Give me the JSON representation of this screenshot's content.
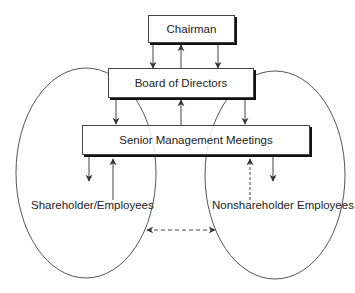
{
  "diagram": {
    "boxes": {
      "chairman": "Chairman",
      "board": "Board of Directors",
      "senior_management": "Senior Management Meetings"
    },
    "groups": {
      "shareholder_employees": "Shareholder/Employees",
      "nonshareholder_employees": "Nonshareholder Employees"
    },
    "arrows": [
      {
        "from": "Chairman",
        "to": "Board of Directors",
        "style": "solid"
      },
      {
        "from": "Board of Directors",
        "to": "Chairman",
        "style": "solid"
      },
      {
        "from": "Chairman",
        "to": "Board of Directors",
        "style": "solid"
      },
      {
        "from": "Board of Directors",
        "to": "Senior Management Meetings",
        "style": "solid"
      },
      {
        "from": "Senior Management Meetings",
        "to": "Board of Directors",
        "style": "solid"
      },
      {
        "from": "Board of Directors",
        "to": "Senior Management Meetings",
        "style": "solid"
      },
      {
        "from": "Senior Management Meetings",
        "to": "Shareholder/Employees",
        "style": "solid"
      },
      {
        "from": "Shareholder/Employees",
        "to": "Senior Management Meetings",
        "style": "solid"
      },
      {
        "from": "Nonshareholder Employees",
        "to": "Senior Management Meetings",
        "style": "dashed"
      },
      {
        "from": "Senior Management Meetings",
        "to": "Nonshareholder Employees",
        "style": "solid"
      },
      {
        "from": "Shareholder/Employees",
        "to": "Nonshareholder Employees",
        "style": "dashed-bidirectional"
      }
    ]
  }
}
